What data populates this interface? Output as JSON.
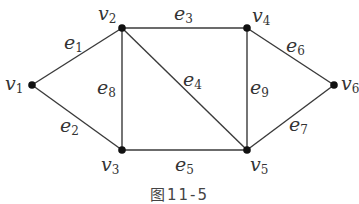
{
  "figure": {
    "caption": "图11-5",
    "colors": {
      "edge": "#3a3a3a",
      "vertex": "#111111",
      "label": "#333333"
    }
  },
  "vertices": [
    {
      "id": "v1",
      "name": "v",
      "sub": "1",
      "x": 32,
      "y": 85
    },
    {
      "id": "v2",
      "name": "v",
      "sub": "2",
      "x": 122,
      "y": 28
    },
    {
      "id": "v3",
      "name": "v",
      "sub": "3",
      "x": 122,
      "y": 150
    },
    {
      "id": "v4",
      "name": "v",
      "sub": "4",
      "x": 247,
      "y": 28
    },
    {
      "id": "v5",
      "name": "v",
      "sub": "5",
      "x": 247,
      "y": 150
    },
    {
      "id": "v6",
      "name": "v",
      "sub": "6",
      "x": 334,
      "y": 85
    }
  ],
  "edges": [
    {
      "id": "e1",
      "name": "e",
      "sub": "1",
      "from": "v1",
      "to": "v2"
    },
    {
      "id": "e2",
      "name": "e",
      "sub": "2",
      "from": "v1",
      "to": "v3"
    },
    {
      "id": "e3",
      "name": "e",
      "sub": "3",
      "from": "v2",
      "to": "v4"
    },
    {
      "id": "e4",
      "name": "e",
      "sub": "4",
      "from": "v2",
      "to": "v5"
    },
    {
      "id": "e5",
      "name": "e",
      "sub": "5",
      "from": "v3",
      "to": "v5"
    },
    {
      "id": "e6",
      "name": "e",
      "sub": "6",
      "from": "v4",
      "to": "v6"
    },
    {
      "id": "e7",
      "name": "e",
      "sub": "7",
      "from": "v5",
      "to": "v6"
    },
    {
      "id": "e8",
      "name": "e",
      "sub": "8",
      "from": "v2",
      "to": "v3"
    },
    {
      "id": "e9",
      "name": "e",
      "sub": "9",
      "from": "v4",
      "to": "v5"
    }
  ],
  "labels": {
    "v1": {
      "name": "v",
      "sub": "1"
    },
    "v2": {
      "name": "v",
      "sub": "2"
    },
    "v3": {
      "name": "v",
      "sub": "3"
    },
    "v4": {
      "name": "v",
      "sub": "4"
    },
    "v5": {
      "name": "v",
      "sub": "5"
    },
    "v6": {
      "name": "v",
      "sub": "6"
    },
    "e1": {
      "name": "e",
      "sub": "1"
    },
    "e2": {
      "name": "e",
      "sub": "2"
    },
    "e3": {
      "name": "e",
      "sub": "3"
    },
    "e4": {
      "name": "e",
      "sub": "4"
    },
    "e5": {
      "name": "e",
      "sub": "5"
    },
    "e6": {
      "name": "e",
      "sub": "6"
    },
    "e7": {
      "name": "e",
      "sub": "7"
    },
    "e8": {
      "name": "e",
      "sub": "8"
    },
    "e9": {
      "name": "e",
      "sub": "9"
    }
  }
}
